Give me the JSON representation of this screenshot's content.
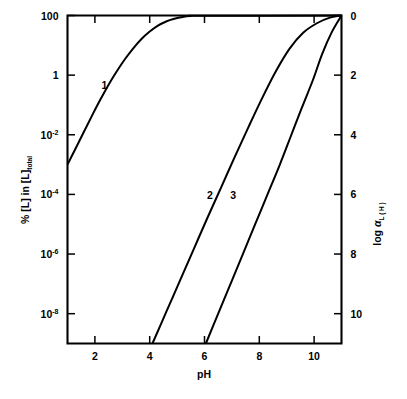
{
  "chart_data": {
    "type": "line",
    "title": "",
    "subtitle": "",
    "xlabel": "pH",
    "ylabel": "% [L] in [L]",
    "ylabel_sub": "total",
    "ylabel_right_prefix": "log",
    "ylabel_right_symbol": "α",
    "ylabel_right_sub": "L ( H )",
    "xlim": [
      1,
      11
    ],
    "ylim_left_log10": [
      -9,
      2
    ],
    "ylim_right": [
      11,
      0
    ],
    "grid": false,
    "legend": "inline curve numbers",
    "x_ticks": [
      2,
      4,
      6,
      8,
      10
    ],
    "x_tick_labels": [
      "2",
      "4",
      "6",
      "8",
      "10"
    ],
    "y_ticks_left": [
      {
        "label": "100",
        "exp": "",
        "log10": 2
      },
      {
        "label": "1",
        "exp": "",
        "log10": 0
      },
      {
        "label": "10",
        "exp": "-2",
        "log10": -2
      },
      {
        "label": "10",
        "exp": "-4",
        "log10": -4
      },
      {
        "label": "10",
        "exp": "-6",
        "log10": -6
      },
      {
        "label": "10",
        "exp": "-8",
        "log10": -8
      }
    ],
    "y_ticks_right": [
      {
        "label": "0",
        "value": 0
      },
      {
        "label": "2",
        "value": 2
      },
      {
        "label": "4",
        "value": 4
      },
      {
        "label": "6",
        "value": 6
      },
      {
        "label": "8",
        "value": 8
      },
      {
        "label": "10",
        "value": 10
      }
    ],
    "series": [
      {
        "name": "1",
        "label": "1",
        "label_pH": 2.35,
        "label_percent_log10": -0.45,
        "description": "monoprotic ligand, pK about 3.1; rises from 1e-3 % at pH 1 to 100 % plateau by pH 5.5",
        "points": [
          {
            "pH": 1.0,
            "pct_log10": -3.0
          },
          {
            "pH": 1.3,
            "pct_log10": -2.45
          },
          {
            "pH": 1.6,
            "pct_log10": -1.9
          },
          {
            "pH": 1.9,
            "pct_log10": -1.35
          },
          {
            "pH": 2.2,
            "pct_log10": -0.82
          },
          {
            "pH": 2.5,
            "pct_log10": -0.32
          },
          {
            "pH": 2.8,
            "pct_log10": 0.13
          },
          {
            "pH": 3.1,
            "pct_log10": 0.54
          },
          {
            "pH": 3.4,
            "pct_log10": 0.9
          },
          {
            "pH": 3.7,
            "pct_log10": 1.21
          },
          {
            "pH": 4.0,
            "pct_log10": 1.46
          },
          {
            "pH": 4.3,
            "pct_log10": 1.66
          },
          {
            "pH": 4.6,
            "pct_log10": 1.8
          },
          {
            "pH": 4.9,
            "pct_log10": 1.89
          },
          {
            "pH": 5.2,
            "pct_log10": 1.95
          },
          {
            "pH": 5.5,
            "pct_log10": 1.98
          },
          {
            "pH": 5.9,
            "pct_log10": 1.99
          },
          {
            "pH": 11.0,
            "pct_log10": 2.0
          }
        ]
      },
      {
        "name": "2",
        "label": "2",
        "label_pH": 6.2,
        "label_percent_log10": -4.15,
        "description": "polyprotic ligand; log alpha slope about 3 per pH unit from pH 4.1 to 9, then curves to 100 % at pH 11",
        "points": [
          {
            "pH": 4.1,
            "pct_log10": -9.0
          },
          {
            "pH": 4.6,
            "pct_log10": -7.95
          },
          {
            "pH": 5.1,
            "pct_log10": -6.9
          },
          {
            "pH": 5.6,
            "pct_log10": -5.85
          },
          {
            "pH": 6.1,
            "pct_log10": -4.8
          },
          {
            "pH": 6.6,
            "pct_log10": -3.78
          },
          {
            "pH": 7.1,
            "pct_log10": -2.75
          },
          {
            "pH": 7.6,
            "pct_log10": -1.75
          },
          {
            "pH": 8.1,
            "pct_log10": -0.78
          },
          {
            "pH": 8.6,
            "pct_log10": 0.12
          },
          {
            "pH": 9.1,
            "pct_log10": 0.88
          },
          {
            "pH": 9.6,
            "pct_log10": 1.42
          },
          {
            "pH": 10.1,
            "pct_log10": 1.74
          },
          {
            "pH": 10.55,
            "pct_log10": 1.92
          },
          {
            "pH": 11.0,
            "pct_log10": 2.0
          }
        ]
      },
      {
        "name": "3",
        "label": "3",
        "label_pH": 7.05,
        "label_percent_log10": -4.15,
        "description": "polyprotic ligand shifted about 2 pH units higher; rises from pH 6.05 and merges with curve 2 near pH 9.5",
        "points": [
          {
            "pH": 6.05,
            "pct_log10": -9.0
          },
          {
            "pH": 6.5,
            "pct_log10": -8.0
          },
          {
            "pH": 6.95,
            "pct_log10": -7.0
          },
          {
            "pH": 7.4,
            "pct_log10": -6.0
          },
          {
            "pH": 7.85,
            "pct_log10": -5.0
          },
          {
            "pH": 8.3,
            "pct_log10": -4.0
          },
          {
            "pH": 8.75,
            "pct_log10": -3.0
          },
          {
            "pH": 9.15,
            "pct_log10": -2.05
          },
          {
            "pH": 9.55,
            "pct_log10": -1.1
          },
          {
            "pH": 9.95,
            "pct_log10": -0.18
          },
          {
            "pH": 10.3,
            "pct_log10": 0.72
          },
          {
            "pH": 10.65,
            "pct_log10": 1.45
          },
          {
            "pH": 11.0,
            "pct_log10": 2.0
          }
        ]
      }
    ]
  }
}
